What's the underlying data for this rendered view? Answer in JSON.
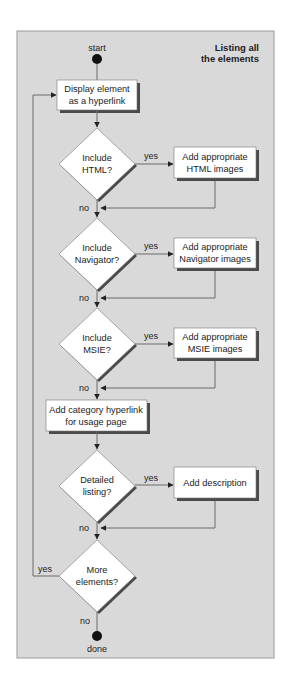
{
  "diagram": {
    "title_line1": "Listing all",
    "title_line2": "the elements",
    "start_label": "start",
    "end_label": "done",
    "colors": {
      "panel": "#d9d9d9",
      "panel_border": "#9a9a9a",
      "box_fill": "#ffffff",
      "shadow": "#4a4a4a",
      "line": "#6a6a6a",
      "dot": "#111111"
    },
    "nodes": {
      "display": {
        "line1": "Display element",
        "line2": "as a hyperlink"
      },
      "html_decision": {
        "line1": "Include",
        "line2": "HTML?"
      },
      "html_action": {
        "line1": "Add appropriate",
        "line2": "HTML images"
      },
      "nav_decision": {
        "line1": "Include",
        "line2": "Navigator?"
      },
      "nav_action": {
        "line1": "Add appropriate",
        "line2": "Navigator images"
      },
      "msie_decision": {
        "line1": "Include",
        "line2": "MSIE?"
      },
      "msie_action": {
        "line1": "Add appropriate",
        "line2": "MSIE images"
      },
      "category": {
        "line1": "Add category hyperlink",
        "line2": "for usage page"
      },
      "detail_decision": {
        "line1": "Detailed",
        "line2": "listing?"
      },
      "detail_action": {
        "line1": "Add description"
      },
      "more_decision": {
        "line1": "More",
        "line2": "elements?"
      }
    },
    "edge_labels": {
      "yes": "yes",
      "no": "no"
    }
  }
}
